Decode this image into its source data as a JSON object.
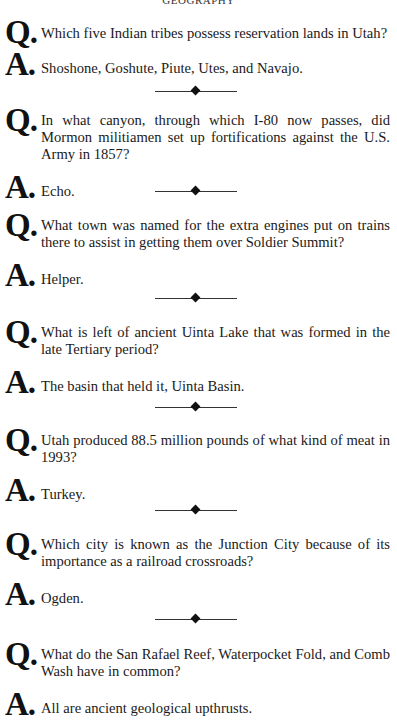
{
  "running_head": "GEOGRAPHY",
  "qa_prefix": {
    "q": "Q",
    "a": "A",
    "dot": "."
  },
  "items": [
    {
      "question": "Which five Indian tribes possess reservation lands in Utah?",
      "answer": "Shoshone, Goshute, Piute, Utes, and Navajo."
    },
    {
      "question": "In what canyon, through which I-80 now passes, did Mormon militiamen set up fortifications against the U.S. Army in 1857?",
      "answer": "Echo."
    },
    {
      "question": "What town was named for the extra engines put on trains there to assist in getting them over Soldier Summit?",
      "answer": "Helper."
    },
    {
      "question": "What is left of ancient Uinta Lake that was formed in the late Tertiary period?",
      "answer": "The basin that held it, Uinta Basin."
    },
    {
      "question": "Utah produced 88.5 million pounds of what kind of meat in 1993?",
      "answer": "Turkey."
    },
    {
      "question": "Which city is known as the Junction City because of its importance as a railroad crossroads?",
      "answer": "Ogden."
    },
    {
      "question": "What do the San Rafael Reef, Waterpocket Fold, and Comb Wash have in common?",
      "answer": "All are ancient geological upthrusts."
    }
  ],
  "divider_icon": "diamond-ornament"
}
